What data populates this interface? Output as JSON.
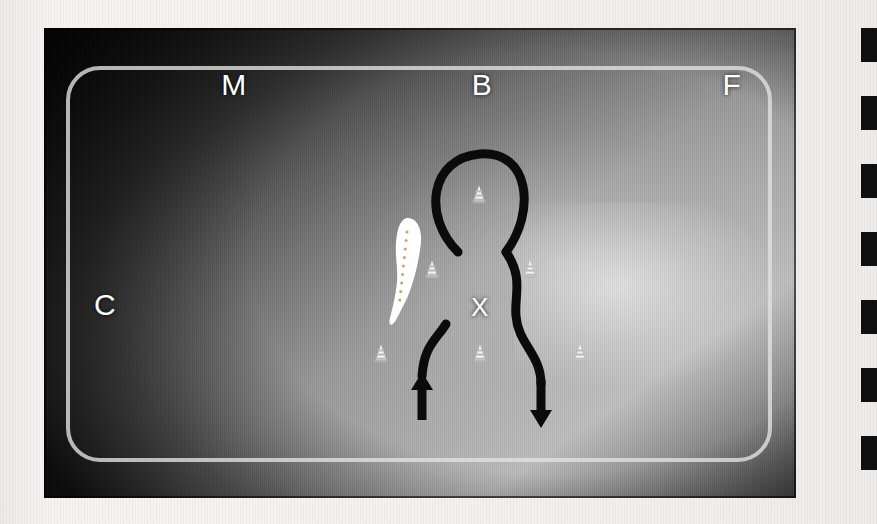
{
  "document": {
    "kind": "dressage-arena-diagram",
    "medium": "photograph of a screen on a bound page"
  },
  "arena": {
    "label": "Dressage arena",
    "rail_color": "#e1e1e1",
    "field_color": "#9a9a9a",
    "letters": [
      {
        "id": "M",
        "text": "M",
        "x": 190,
        "y": 57,
        "side": "top"
      },
      {
        "id": "B",
        "text": "B",
        "x": 438,
        "y": 57,
        "side": "top"
      },
      {
        "id": "F",
        "text": "F",
        "x": 688,
        "y": 57,
        "side": "top"
      },
      {
        "id": "C",
        "text": "C",
        "x": 61,
        "y": 277,
        "side": "left"
      },
      {
        "id": "A",
        "text": "A",
        "x": 818,
        "y": 277,
        "side": "right"
      },
      {
        "id": "H",
        "text": "H",
        "x": 190,
        "y": 482,
        "side": "bottom"
      },
      {
        "id": "E",
        "text": "E",
        "x": 438,
        "y": 482,
        "side": "bottom"
      },
      {
        "id": "K",
        "text": "K",
        "x": 688,
        "y": 482,
        "side": "bottom"
      }
    ],
    "centre_marker": {
      "id": "X",
      "text": "X",
      "x": 436,
      "y": 279
    }
  },
  "cones": {
    "label": "Training cones",
    "body_color": "#f2f2f2",
    "stripe_color": "#b9b9b9",
    "count": 6,
    "positions": [
      {
        "id": "cone-top-centre",
        "x": 435,
        "y": 166
      },
      {
        "id": "cone-mid-left",
        "x": 388,
        "y": 241
      },
      {
        "id": "cone-mid-right",
        "x": 486,
        "y": 241
      },
      {
        "id": "cone-bottom-left",
        "x": 337,
        "y": 325
      },
      {
        "id": "cone-bottom-centre",
        "x": 436,
        "y": 325
      },
      {
        "id": "cone-bottom-right",
        "x": 536,
        "y": 325
      }
    ]
  },
  "ride_path": {
    "label": "Ridden figure-of-eight / teardrop pattern",
    "stroke_color": "#0b0b0b",
    "stroke_width": 9,
    "entry_arrow": {
      "id": "entry-arrow",
      "direction": "up",
      "tip_x": 378,
      "tip_y": 344,
      "tail_x": 378,
      "tail_y": 392
    },
    "exit_arrow": {
      "id": "exit-arrow",
      "direction": "down",
      "tip_x": 497,
      "tip_y": 400,
      "tail_x": 497,
      "tail_y": 352
    },
    "segments": [
      {
        "id": "upper-loop",
        "d": "M 414 224 C 378 188 386 130 436 126 C 486 122 492 184 462 224"
      },
      {
        "id": "right-descent",
        "d": "M 462 224 C 480 250 470 268 472 288 C 474 316 497 326 497 356"
      },
      {
        "id": "left-descent",
        "d": "M 402 296 C 392 312 380 318 378 348"
      }
    ]
  },
  "highlight": {
    "label": "White marker highlight over centre line",
    "color": "#ffffff",
    "dot_color": "#c9a06a",
    "dot_count": 9
  },
  "binding": {
    "label": "Perforated page binding edge",
    "hole_color": "#101010",
    "hole_count": 7,
    "hole_tops": [
      28,
      96,
      164,
      232,
      300,
      368,
      436
    ]
  }
}
